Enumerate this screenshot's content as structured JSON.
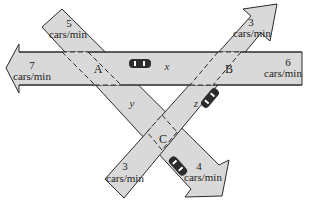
{
  "diagram": {
    "roads": [
      {
        "id": "horizontal",
        "direction": "right-to-left",
        "inflow": {
          "value": "6",
          "unit": "cars/min",
          "side": "right"
        },
        "outflow": {
          "value": "7",
          "unit": "cars/min",
          "side": "left"
        }
      },
      {
        "id": "diagonal-down",
        "direction": "upper-left to lower-right",
        "inflow": {
          "value": "5",
          "unit": "cars/min",
          "side": "upper-left"
        },
        "outflow": {
          "value": "4",
          "unit": "cars/min",
          "side": "lower-right"
        }
      },
      {
        "id": "diagonal-up",
        "direction": "lower-left to upper-right",
        "inflow": {
          "value": "3",
          "unit": "cars/min",
          "side": "lower-left"
        },
        "outflow": {
          "value": "3",
          "unit": "cars/min",
          "side": "upper-right"
        }
      }
    ],
    "intersections": [
      "A",
      "B",
      "C"
    ],
    "variables": {
      "x": "x",
      "y": "y",
      "z": "z"
    },
    "colors": {
      "road_fill": "#d9d9d9",
      "outline": "#2a2a2a",
      "car": "#2b2b2b",
      "background": "#ffffff"
    }
  },
  "labels": {
    "top_left_num": "5",
    "top_left_unit": "cars/min",
    "left_num": "7",
    "left_unit": "cars/min",
    "top_right_num": "3",
    "top_right_unit": "cars/min",
    "right_num": "6",
    "right_unit": "cars/min",
    "bottom_left_num": "3",
    "bottom_left_unit": "cars/min",
    "bottom_right_num": "4",
    "bottom_right_unit": "cars/min",
    "node_a": "A",
    "node_b": "B",
    "node_c": "C",
    "var_x": "x",
    "var_y": "y",
    "var_z": "z"
  }
}
